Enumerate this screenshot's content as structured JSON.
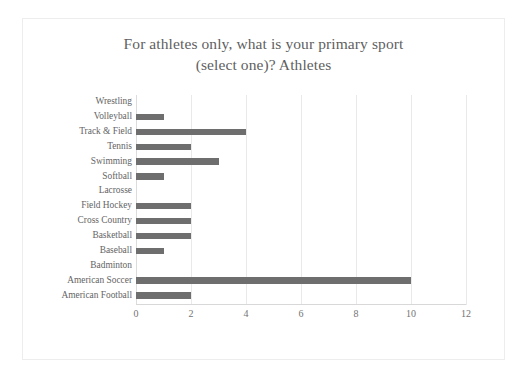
{
  "chart": {
    "title_lines": [
      "For athletes only, what is your primary sport",
      "(select one)? Athletes"
    ],
    "legend_label": "Q3. For athletes only, what is your primary sport (select one)? Athletes",
    "legend_marker": "square-marker-icon",
    "bar_color": "#6e6e6e",
    "gridline_color": "#e9e9e9",
    "frame_color": "#ededed",
    "text_color": "#646464",
    "title_color": "#5f5f5f"
  },
  "chart_data": {
    "type": "bar",
    "orientation": "horizontal",
    "title": "For athletes only, what is your primary sport (select one)? Athletes",
    "xlabel": "",
    "ylabel": "",
    "xlim": [
      0,
      12
    ],
    "xticks": [
      0,
      2,
      4,
      6,
      8,
      10,
      12
    ],
    "grid": true,
    "legend_position": "bottom",
    "categories": [
      "Wrestling",
      "Volleyball",
      "Track & Field",
      "Tennis",
      "Swimming",
      "Softball",
      "Lacrosse",
      "Field Hockey",
      "Cross Country",
      "Basketball",
      "Baseball",
      "Badminton",
      "American Soccer",
      "American Football"
    ],
    "values": [
      0,
      1,
      4,
      2,
      3,
      1,
      0,
      2,
      2,
      2,
      1,
      0,
      10,
      2
    ],
    "series": [
      {
        "name": "Q3. For athletes only, what is your primary sport (select one)? Athletes",
        "values": [
          0,
          1,
          4,
          2,
          3,
          1,
          0,
          2,
          2,
          2,
          1,
          0,
          10,
          2
        ]
      }
    ]
  }
}
